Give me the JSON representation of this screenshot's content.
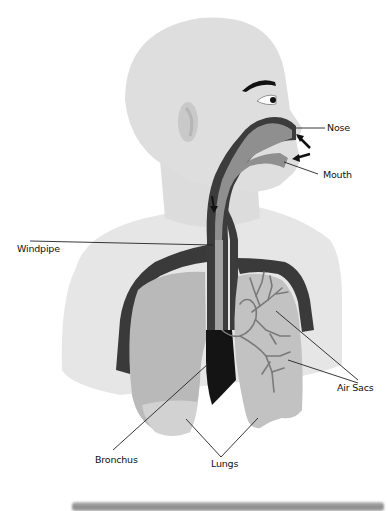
{
  "diagram": {
    "labels": {
      "nose": "Nose",
      "mouth": "Mouth",
      "windpipe": "Windpipe",
      "air_sacs": "Air Sacs",
      "bronchus": "Bronchus",
      "lungs": "Lungs"
    },
    "colors": {
      "body": "#e8e8e8",
      "head": "#dedede",
      "airway_dark": "#3a3a3a",
      "airway_mid": "#8d8d8d",
      "lung": "#b8b8b8",
      "lung_light": "#cfcfcf",
      "bronchi_tree": "#7c7c7c",
      "leader_lines": "#222222"
    }
  }
}
